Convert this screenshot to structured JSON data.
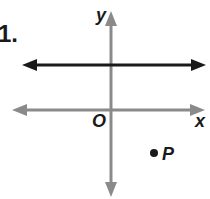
{
  "problem_number": "1.",
  "axes": {
    "x_label": "x",
    "y_label": "y",
    "origin_label": "O",
    "axis_color": "#8a8a8a"
  },
  "line": {
    "description": "horizontal line above x-axis",
    "color": "#1a1a1a"
  },
  "point": {
    "label": "P",
    "color": "#1a1a1a"
  }
}
